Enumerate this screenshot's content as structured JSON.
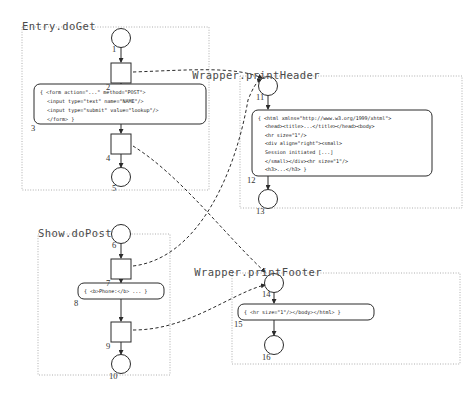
{
  "diagram": {
    "clusters": [
      {
        "id": "entry-doget",
        "label": "Entry.doGet",
        "label_x": 22,
        "label_y": 30,
        "frame": {
          "x": 22,
          "y": 27,
          "w": 187,
          "h": 163
        }
      },
      {
        "id": "show-dopost",
        "label": "Show.doPost",
        "label_x": 38,
        "label_y": 237,
        "frame": {
          "x": 38,
          "y": 234,
          "w": 132,
          "h": 141
        }
      },
      {
        "id": "wrapper-printheader",
        "label": "Wrapper.printHeader",
        "label_x": 320,
        "label_y": 79,
        "frame": {
          "x": 240,
          "y": 76,
          "w": 222,
          "h": 132
        }
      },
      {
        "id": "wrapper-printfooter",
        "label": "Wrapper.printFooter",
        "label_x": 322,
        "label_y": 276,
        "frame": {
          "x": 232,
          "y": 273,
          "w": 228,
          "h": 91
        }
      }
    ],
    "nodes": [
      {
        "id": 1,
        "num": "1",
        "shape": "circle",
        "cx": 121,
        "cy": 38,
        "r": 9.5,
        "num_x": 112,
        "num_y": 52
      },
      {
        "id": 2,
        "num": "2",
        "shape": "square",
        "x": 111,
        "y": 63,
        "w": 20,
        "h": 20,
        "num_x": 106,
        "num_y": 90
      },
      {
        "id": 3,
        "num": "3",
        "shape": "code",
        "x": 34,
        "y": 84,
        "w": 172,
        "h": 40,
        "num_x": 31,
        "num_y": 131
      },
      {
        "id": 4,
        "num": "4",
        "shape": "square",
        "x": 111,
        "y": 134,
        "w": 20,
        "h": 20,
        "num_x": 106,
        "num_y": 161
      },
      {
        "id": 5,
        "num": "5",
        "shape": "circle",
        "cx": 121,
        "cy": 177,
        "r": 9.5,
        "num_x": 112,
        "num_y": 191
      },
      {
        "id": 6,
        "num": "6",
        "shape": "circle",
        "cx": 121,
        "cy": 234,
        "r": 9.5,
        "num_x": 112,
        "num_y": 248
      },
      {
        "id": 7,
        "num": "7",
        "shape": "square",
        "x": 111,
        "y": 259,
        "w": 20,
        "h": 20,
        "num_x": 106,
        "num_y": 286
      },
      {
        "id": 8,
        "num": "8",
        "shape": "code",
        "x": 78,
        "y": 283,
        "w": 86,
        "h": 16,
        "num_x": 74,
        "num_y": 306
      },
      {
        "id": 9,
        "num": "9",
        "shape": "square",
        "x": 111,
        "y": 322,
        "w": 20,
        "h": 20,
        "num_x": 106,
        "num_y": 349
      },
      {
        "id": 10,
        "num": "10",
        "shape": "circle",
        "cx": 121,
        "cy": 364,
        "r": 9.5,
        "num_x": 109,
        "num_y": 379
      },
      {
        "id": 11,
        "num": "11",
        "shape": "circle",
        "cx": 268,
        "cy": 86,
        "r": 9.5,
        "num_x": 256,
        "num_y": 100
      },
      {
        "id": 12,
        "num": "12",
        "shape": "code",
        "x": 252,
        "y": 110,
        "w": 180,
        "h": 66,
        "num_x": 247,
        "num_y": 183
      },
      {
        "id": 13,
        "num": "13",
        "shape": "circle",
        "cx": 268,
        "cy": 199,
        "r": 9.5,
        "num_x": 256,
        "num_y": 214
      },
      {
        "id": 14,
        "num": "14",
        "shape": "circle",
        "cx": 274,
        "cy": 283,
        "r": 9.5,
        "num_x": 262,
        "num_y": 297
      },
      {
        "id": 15,
        "num": "15",
        "shape": "code",
        "x": 238,
        "y": 304,
        "w": 136,
        "h": 16,
        "num_x": 234,
        "num_y": 327
      },
      {
        "id": 16,
        "num": "16",
        "shape": "circle",
        "cx": 274,
        "cy": 345,
        "r": 9.5,
        "num_x": 262,
        "num_y": 360
      }
    ],
    "code_blocks": [
      {
        "node": 3,
        "lines": [
          "{ <form action=\"...\" method=\"POST\">",
          "<input type=\"text\" name=\"NAME\"/>",
          "<input type=\"submit\" value=\"lookup\"/>",
          "</form> }"
        ]
      },
      {
        "node": 12,
        "lines": [
          "{ <html xmlns=\"http://www.w3.org/1999/xhtml\">",
          "<head><title>...</title></head><body>",
          "<hr size=\"1\"/>",
          "<div align=\"right\"><small>",
          "Session initiated [...]",
          "</small></div><hr size=\"1\"/>",
          "<h3>...</h3> }"
        ]
      },
      {
        "node": 8,
        "lines": [
          "{ <b>Phone:</b> ... }"
        ]
      },
      {
        "node": 15,
        "lines": [
          "{ <hr size=\"1\"/></body></html> }"
        ]
      }
    ],
    "solid_edges": [
      {
        "from": 1,
        "to": 2,
        "x1": 121,
        "y1": 47.5,
        "x2": 121,
        "y2": 62
      },
      {
        "from": 2,
        "to": 3,
        "x1": 121,
        "y1": 83,
        "x2": 121,
        "y2": 83.5
      },
      {
        "from": 3,
        "to": 4,
        "x1": 121,
        "y1": 124,
        "x2": 121,
        "y2": 133
      },
      {
        "from": 4,
        "to": 5,
        "x1": 121,
        "y1": 154,
        "x2": 121,
        "y2": 167
      },
      {
        "from": 6,
        "to": 7,
        "x1": 121,
        "y1": 243.5,
        "x2": 121,
        "y2": 258
      },
      {
        "from": 7,
        "to": 8,
        "x1": 121,
        "y1": 279,
        "x2": 121,
        "y2": 282.5
      },
      {
        "from": 8,
        "to": 9,
        "x1": 121,
        "y1": 299,
        "x2": 121,
        "y2": 321
      },
      {
        "from": 9,
        "to": 10,
        "x1": 121,
        "y1": 342,
        "x2": 121,
        "y2": 354
      },
      {
        "from": 11,
        "to": 12,
        "x1": 268,
        "y1": 95.5,
        "x2": 268,
        "y2": 109
      },
      {
        "from": 12,
        "to": 13,
        "x1": 268,
        "y1": 176,
        "x2": 268,
        "y2": 189
      },
      {
        "from": 14,
        "to": 15,
        "x1": 274,
        "y1": 292.5,
        "x2": 274,
        "y2": 303
      },
      {
        "from": 15,
        "to": 16,
        "x1": 274,
        "y1": 320,
        "x2": 274,
        "y2": 335
      }
    ],
    "dashed_edges": [
      {
        "from": 2,
        "to": 11,
        "path": "M 133,72 C 190,70 235,66 262,78"
      },
      {
        "from": 7,
        "to": 11,
        "path": "M 133,266 C 200,258 236,170 248,100 C 252,90 256,82 261,79"
      },
      {
        "from": 4,
        "to": 14,
        "path": "M 133,146 C 180,175 225,235 265,272"
      },
      {
        "from": 9,
        "to": 14,
        "path": "M 133,330 C 180,330 215,305 250,290 C 255,288 260,286 265,285"
      }
    ],
    "style": {
      "stroke": "#2b2b2b",
      "cluster_stroke": "#9a9a9a",
      "code_fill": "#ffffff",
      "background": "#ffffff"
    }
  }
}
